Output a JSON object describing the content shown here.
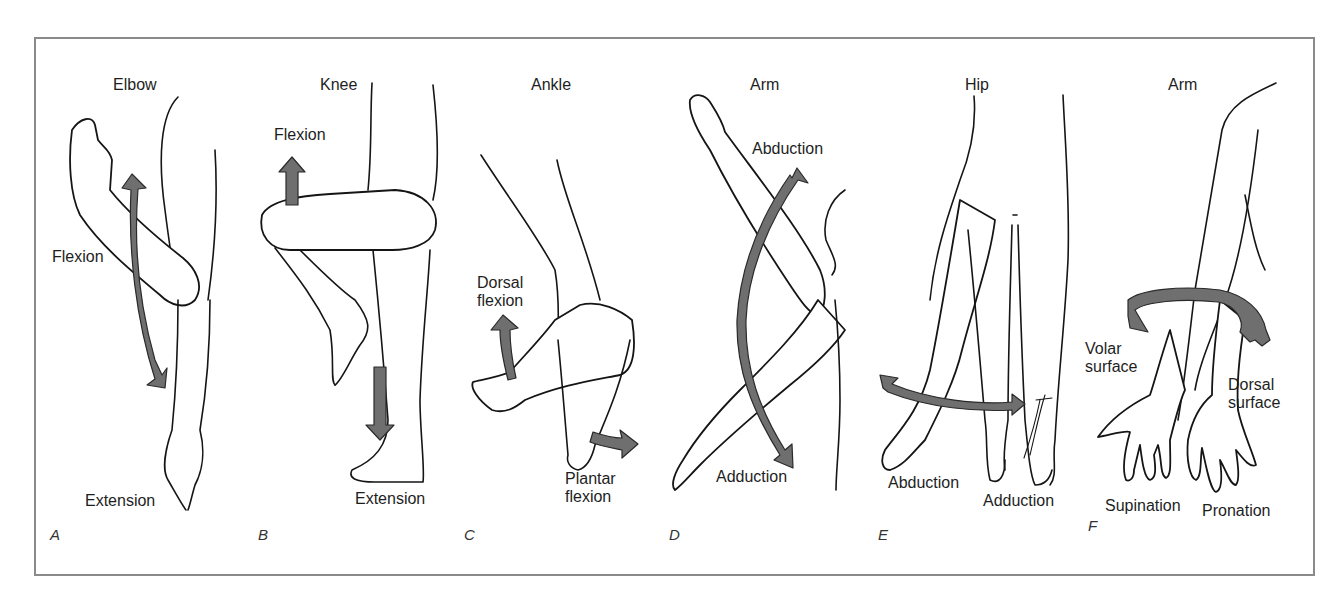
{
  "figure": {
    "border_color": "#8a8a8a",
    "arrow_fill": "#6f6f6f",
    "panels": [
      {
        "letter": "A",
        "title": "Elbow",
        "labels": {
          "upper": "Flexion",
          "lower": "Extension"
        }
      },
      {
        "letter": "B",
        "title": "Knee",
        "labels": {
          "upper": "Flexion",
          "lower": "Extension"
        }
      },
      {
        "letter": "C",
        "title": "Ankle",
        "labels": {
          "upper": "Dorsal\nflexion",
          "lower": "Plantar\nflexion"
        }
      },
      {
        "letter": "D",
        "title": "Arm",
        "labels": {
          "upper": "Abduction",
          "lower": "Adduction"
        }
      },
      {
        "letter": "E",
        "title": "Hip",
        "labels": {
          "left": "Abduction",
          "right": "Adduction"
        }
      },
      {
        "letter": "F",
        "title": "Arm",
        "labels": {
          "volar": "Volar\nsurface",
          "dorsal": "Dorsal\nsurface",
          "left": "Supination",
          "right": "Pronation"
        }
      }
    ]
  }
}
